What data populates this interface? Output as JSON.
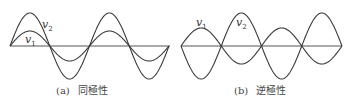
{
  "panels": [
    {
      "id": "a",
      "caption_tag": "(a)",
      "caption_text": "同極性",
      "polarity": "same",
      "cycles": 2,
      "v1": {
        "label": "v",
        "subscript": "1",
        "amplitude": 15,
        "sign": 1
      },
      "v2": {
        "label": "v",
        "subscript": "2",
        "amplitude": 33,
        "sign": 1
      }
    },
    {
      "id": "b",
      "caption_tag": "(b)",
      "caption_text": "逆極性",
      "polarity": "opposite",
      "cycles": 2,
      "v1": {
        "label": "v",
        "subscript": "1",
        "amplitude": 18,
        "sign": 1
      },
      "v2": {
        "label": "v",
        "subscript": "2",
        "amplitude": 33,
        "sign": -1
      }
    }
  ],
  "stroke_color": "#3a3a3a"
}
